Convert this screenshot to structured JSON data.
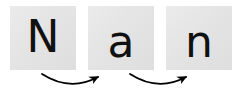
{
  "canvas": {
    "width": 244,
    "height": 99,
    "background_color": "#ffffff"
  },
  "word": "Nan",
  "tiles": [
    {
      "letter": "N",
      "case": "uppercase",
      "tile_color": "#e4e4e4",
      "text_color": "#111111"
    },
    {
      "letter": "a",
      "case": "lowercase",
      "tile_color": "#e4e4e4",
      "text_color": "#111111"
    },
    {
      "letter": "n",
      "case": "lowercase",
      "tile_color": "#e4e4e4",
      "text_color": "#111111"
    }
  ],
  "arrows": [
    {
      "name": "arrow-n-to-a",
      "from_tile": "N",
      "to_tile": "a",
      "direction": "left-to-right",
      "shape": "curved-downward-arc",
      "color": "#000000"
    },
    {
      "name": "arrow-a-to-n",
      "from_tile": "a",
      "to_tile": "n",
      "direction": "left-to-right",
      "shape": "curved-downward-arc",
      "color": "#000000"
    }
  ]
}
